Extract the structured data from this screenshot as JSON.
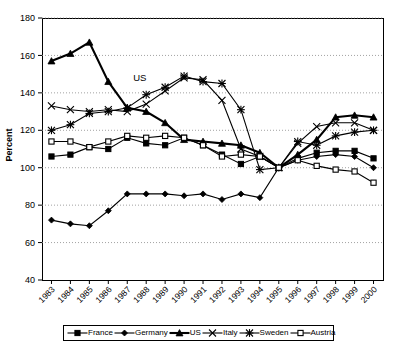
{
  "chart_data": {
    "type": "line",
    "title": "",
    "xlabel": "",
    "ylabel": "Percent",
    "ylim": [
      40,
      180
    ],
    "ytick_step": 20,
    "yticks": [
      40,
      60,
      80,
      100,
      120,
      140,
      160,
      180
    ],
    "grid": true,
    "grid_style": "dotted-horizontal",
    "legend_position": "bottom",
    "annotations": [
      {
        "text": "US",
        "x": "1987",
        "y": 148
      }
    ],
    "categories": [
      "1983",
      "1984",
      "1985",
      "1986",
      "1987",
      "1988",
      "1989",
      "1990",
      "1991",
      "1992",
      "1993",
      "1994",
      "1995",
      "1996",
      "1997",
      "1998",
      "1999",
      "2000"
    ],
    "x": [
      "1983",
      "1984",
      "1985",
      "1986",
      "1987",
      "1988",
      "1989",
      "1990",
      "1991",
      "1992",
      "1993",
      "1994",
      "1995",
      "1996",
      "1997",
      "1998",
      "1999",
      "2000"
    ],
    "series": [
      {
        "name": "France",
        "marker": "filled-square",
        "values": [
          106,
          107,
          111,
          110,
          116,
          113,
          112,
          116,
          112,
          107,
          102,
          106,
          100,
          105,
          108,
          109,
          109,
          105
        ]
      },
      {
        "name": "Germany",
        "marker": "filled-diamond",
        "values": [
          72,
          70,
          69,
          77,
          86,
          86,
          86,
          85,
          86,
          83,
          86,
          84,
          100,
          104,
          106,
          107,
          106,
          100
        ]
      },
      {
        "name": "US",
        "marker": "filled-triangle",
        "values": [
          157,
          161,
          167,
          146,
          132,
          130,
          124,
          115,
          114,
          113,
          112,
          108,
          100,
          107,
          115,
          127,
          128,
          127
        ]
      },
      {
        "name": "Italy",
        "marker": "cross-x",
        "values": [
          133,
          131,
          130,
          131,
          130,
          134,
          141,
          148,
          147,
          136,
          110,
          106,
          100,
          113,
          122,
          124,
          124,
          120
        ]
      },
      {
        "name": "Sweden",
        "marker": "asterisk",
        "values": [
          120,
          123,
          129,
          130,
          132,
          139,
          143,
          149,
          146,
          145,
          131,
          99,
          100,
          114,
          112,
          117,
          119,
          120
        ]
      },
      {
        "name": "Austria",
        "marker": "open-square",
        "values": [
          114,
          114,
          111,
          114,
          117,
          116,
          117,
          116,
          112,
          106,
          107,
          106,
          100,
          104,
          101,
          99,
          98,
          92
        ]
      }
    ]
  },
  "legend": {
    "items": [
      {
        "label": "France",
        "marker": "filled-square"
      },
      {
        "label": "Germany",
        "marker": "filled-diamond"
      },
      {
        "label": "US",
        "marker": "filled-triangle"
      },
      {
        "label": "Italy",
        "marker": "cross-x"
      },
      {
        "label": "Sweden",
        "marker": "asterisk"
      },
      {
        "label": "Austria",
        "marker": "open-square"
      }
    ]
  },
  "colors": {
    "line": "#000000",
    "grid": "#999999",
    "background": "#ffffff",
    "axis": "#000000"
  }
}
